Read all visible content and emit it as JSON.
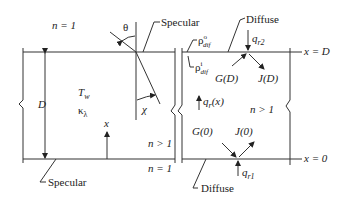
{
  "diagram": {
    "left_slab": {
      "top_medium": "n = 1",
      "bottom_medium": "n = 1",
      "interior_medium": "n > 1",
      "temperature": "T",
      "temperature_sub": "w",
      "absorption": "κ",
      "absorption_sub": "λ",
      "thickness": "D",
      "coordinate": "x",
      "angle_incident": "θ",
      "angle_refracted": "χ",
      "top_surface_label": "Specular",
      "bottom_surface_label": "Specular"
    },
    "right_slab": {
      "interior_medium": "n > 1",
      "top_surface_label": "Diffuse",
      "bottom_surface_label": "Diffuse",
      "rho_outer": "ρ",
      "rho_outer_sup": "o",
      "rho_outer_sub": "dif",
      "rho_inner": "ρ",
      "rho_inner_sup": "i",
      "rho_inner_sub": "dif",
      "flux_top": "q",
      "flux_top_sub": "r2",
      "flux_bottom": "q",
      "flux_bottom_sub": "r1",
      "flux_x": "q",
      "flux_x_sub": "r",
      "flux_x_arg": "(x)",
      "G_top": "G(D)",
      "J_top": "J(D)",
      "G_bottom": "G(0)",
      "J_bottom": "J(0)",
      "x_top": "x = D",
      "x_bottom": "x = 0"
    }
  }
}
